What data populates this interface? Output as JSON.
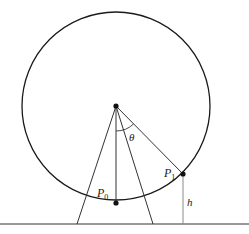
{
  "diagram": {
    "labels": {
      "theta": "θ",
      "p0_main": "P",
      "p0_sub": "0",
      "p1_main": "P",
      "p1_sub": "1",
      "h": "h"
    },
    "colors": {
      "stroke": "#1a1a1a",
      "height_line": "#8a8a8a",
      "background": "#ffffff"
    }
  }
}
